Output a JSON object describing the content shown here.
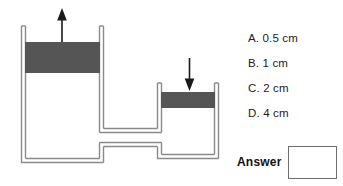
{
  "page": {
    "background_color": "#ffffff",
    "width": 343,
    "height": 186
  },
  "diagram": {
    "name": "hydraulic-press-diagram",
    "piston_color": "#555555",
    "outline_color": "#7a7a7a",
    "arrow_color": "#1a1a1a",
    "left_cylinder": {
      "label": "wide-cylinder",
      "arrow": "up-arrow"
    },
    "right_cylinder": {
      "label": "narrow-cylinder",
      "arrow": "down-arrow"
    },
    "connecting_tube": "horizontal-tube"
  },
  "question": {
    "options": [
      {
        "id": "a",
        "text": "A. 0.5 cm"
      },
      {
        "id": "b",
        "text": "B. 1 cm"
      },
      {
        "id": "c",
        "text": "C. 2 cm"
      },
      {
        "id": "d",
        "text": "D. 4 cm"
      }
    ],
    "answer_label": "Answer",
    "answer_value": ""
  }
}
